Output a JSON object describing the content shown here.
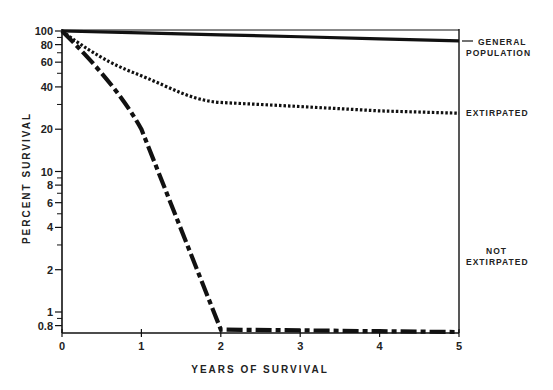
{
  "chart_data": {
    "type": "line",
    "title": "",
    "xlabel": "YEARS OF SURVIVAL",
    "ylabel": "PERCENT SURVIVAL",
    "yscale": "log",
    "xlim": [
      0,
      5
    ],
    "ylim": [
      0.7,
      100
    ],
    "x_ticks": [
      0,
      1,
      2,
      3,
      4,
      5
    ],
    "x_tick_labels": [
      "0",
      "1",
      "2",
      "3",
      "4",
      "5"
    ],
    "y_ticks": [
      100,
      80,
      60,
      40,
      20,
      10,
      8,
      6,
      4,
      2,
      1,
      0.8
    ],
    "y_tick_labels": [
      "100",
      "80",
      "60",
      "40",
      "20",
      "10",
      "8",
      "6",
      "4",
      "2",
      "1",
      "0.8"
    ],
    "grid": false,
    "legend_position": "right (inline labels)",
    "x": [
      0,
      1,
      2,
      3,
      4,
      5
    ],
    "series": [
      {
        "name": "GENERAL POPULATION",
        "style": "solid",
        "values": [
          100,
          97,
          94,
          91,
          88,
          85
        ]
      },
      {
        "name": "EXTIRPATED",
        "style": "dotted",
        "values": [
          100,
          48,
          31,
          29,
          27,
          26
        ]
      },
      {
        "name": "NOT EXTIRPATED",
        "style": "dash-dot",
        "values": [
          100,
          20,
          0.75,
          0.74,
          0.73,
          0.72
        ]
      }
    ]
  },
  "labels": {
    "general": [
      "GENERAL",
      "POPULATION"
    ],
    "extirpated": "EXTIRPATED",
    "not_extirpated": [
      "NOT",
      "EXTIRPATED"
    ],
    "xlabel": "YEARS OF SURVIVAL",
    "ylabel": "PERCENT SURVIVAL"
  }
}
